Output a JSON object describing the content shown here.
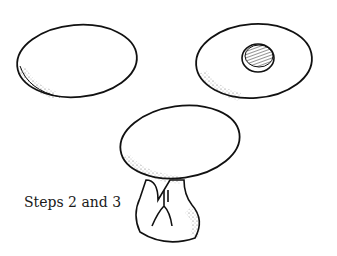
{
  "figure": {
    "caption": "Steps 2 and 3",
    "shapes": [
      {
        "name": "plain-egg",
        "description": "egg shape outline"
      },
      {
        "name": "egg-with-hole",
        "description": "egg shape with shaded hole"
      },
      {
        "name": "egg-on-stand",
        "description": "egg resting on stand with branch carving"
      }
    ],
    "ink_color": "#111111",
    "background": "#ffffff"
  }
}
